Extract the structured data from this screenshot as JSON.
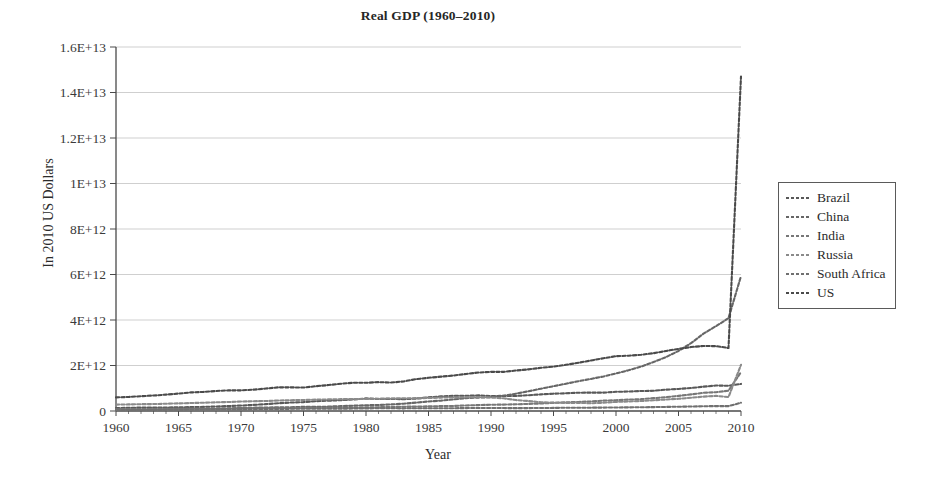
{
  "figure": {
    "title": "Real GDP (1960–2010)",
    "background_color": "#ffffff",
    "width": 928,
    "height": 482
  },
  "axes": {
    "x_title": "Year",
    "y_title": "In 2010 US Dollars",
    "x_ticks": [
      "1960",
      "1965",
      "1970",
      "1975",
      "1980",
      "1985",
      "1990",
      "1995",
      "2000",
      "2005",
      "2010"
    ],
    "y_ticks": [
      "0",
      "2E+12",
      "4E+12",
      "6E+12",
      "8E+12",
      "1E+13",
      "1.2E+13",
      "1.4E+13",
      "1.6E+13"
    ],
    "grid_color": "#c9c9c9",
    "axis_color": "#4a4a4a"
  },
  "legend": {
    "position": "right",
    "entries": [
      {
        "label": "Brazil",
        "color": "#585858",
        "dash": "3,2"
      },
      {
        "label": "China",
        "color": "#666666",
        "dash": "3,2"
      },
      {
        "label": "India",
        "color": "#777777",
        "dash": "3,2"
      },
      {
        "label": "Russia",
        "color": "#8a8a8a",
        "dash": "3,2"
      },
      {
        "label": "South Africa",
        "color": "#707070",
        "dash": "3,2"
      },
      {
        "label": "US",
        "color": "#4a4a4a",
        "dash": "3,2"
      }
    ]
  },
  "chart_data": {
    "type": "line",
    "title": "Real GDP (1960–2010)",
    "xlabel": "Year",
    "ylabel": "In 2010 US Dollars",
    "xlim": [
      1960,
      2010
    ],
    "ylim": [
      0,
      16000000000000
    ],
    "ytick_step": 2000000000000,
    "xtick_step": 5,
    "grid": "horizontal",
    "legend_position": "right",
    "x": [
      1960,
      1961,
      1962,
      1963,
      1964,
      1965,
      1966,
      1967,
      1968,
      1969,
      1970,
      1971,
      1972,
      1973,
      1974,
      1975,
      1976,
      1977,
      1978,
      1979,
      1980,
      1981,
      1982,
      1983,
      1984,
      1985,
      1986,
      1987,
      1988,
      1989,
      1990,
      1991,
      1992,
      1993,
      1994,
      1995,
      1996,
      1997,
      1998,
      1999,
      2000,
      2001,
      2002,
      2003,
      2004,
      2005,
      2006,
      2007,
      2008,
      2009,
      2010
    ],
    "series": [
      {
        "name": "Brazil",
        "color": "#585858",
        "values": [
          130000000000.0,
          142000000000.0,
          149000000000.0,
          150000000000.0,
          155000000000.0,
          160000000000.0,
          172000000000.0,
          180000000000.0,
          199000000000.0,
          217000000000.0,
          240000000000.0,
          268000000000.0,
          301000000000.0,
          343000000000.0,
          371000000000.0,
          391000000000.0,
          431000000000.0,
          452000000000.0,
          474000000000.0,
          506000000000.0,
          553000000000.0,
          529000000000.0,
          533000000000.0,
          518000000000.0,
          546000000000.0,
          598000000000.0,
          643000000000.0,
          666000000000.0,
          666000000000.0,
          687000000000.0,
          658000000000.0,
          665000000000.0,
          661000000000.0,
          694000000000.0,
          731000000000.0,
          762000000000.0,
          778000000000.0,
          805000000000.0,
          806000000000.0,
          808000000000.0,
          843000000000.0,
          855000000000.0,
          878000000000.0,
          888000000000.0,
          939000000000.0,
          969000000000.0,
          1010000000000.0,
          1070000000000.0,
          1120000000000.0,
          1110000000000.0,
          1190000000000.0
        ]
      },
      {
        "name": "China",
        "color": "#666666",
        "values": [
          95000000000.0,
          70000000000.0,
          66000000000.0,
          73000000000.0,
          84000000000.0,
          98000000000.0,
          108000000000.0,
          101000000000.0,
          97000000000.0,
          114000000000.0,
          136000000000.0,
          146000000000.0,
          151000000000.0,
          163000000000.0,
          167000000000.0,
          182000000000.0,
          179000000000.0,
          193000000000.0,
          216000000000.0,
          233000000000.0,
          252000000000.0,
          265000000000.0,
          289000000000.0,
          320000000000.0,
          369000000000.0,
          419000000000.0,
          456000000000.0,
          509000000000.0,
          566000000000.0,
          589000000000.0,
          611000000000.0,
          667000000000.0,
          762000000000.0,
          868000000000.0,
          982000000000.0,
          1090000000000.0,
          1200000000000.0,
          1310000000000.0,
          1410000000000.0,
          1520000000000.0,
          1650000000000.0,
          1790000000000.0,
          1950000000000.0,
          2150000000000.0,
          2370000000000.0,
          2640000000000.0,
          2980000000000.0,
          3400000000000.0,
          3730000000000.0,
          4080000000000.0,
          5930000000000.0
        ]
      },
      {
        "name": "India",
        "color": "#777777",
        "values": [
          79000000000.0,
          82000000000.0,
          84000000000.0,
          90000000000.0,
          96000000000.0,
          92000000000.0,
          93000000000.0,
          101000000000.0,
          104000000000.0,
          111000000000.0,
          117000000000.0,
          118000000000.0,
          117000000000.0,
          122000000000.0,
          123000000000.0,
          135000000000.0,
          137000000000.0,
          148000000000.0,
          156000000000.0,
          147000000000.0,
          158000000000.0,
          168000000000.0,
          175000000000.0,
          188000000000.0,
          195000000000.0,
          205000000000.0,
          214000000000.0,
          222000000000.0,
          245000000000.0,
          260000000000.0,
          275000000000.0,
          281000000000.0,
          296000000000.0,
          310000000000.0,
          330000000000.0,
          355000000000.0,
          382000000000.0,
          397000000000.0,
          421000000000.0,
          456000000000.0,
          474000000000.0,
          500000000000.0,
          520000000000.0,
          564000000000.0,
          609000000000.0,
          666000000000.0,
          729000000000.0,
          799000000000.0,
          825000000000.0,
          894000000000.0,
          1710000000000.0
        ]
      },
      {
        "name": "Russia",
        "color": "#8a8a8a",
        "values": [
          280000000000.0,
          290000000000.0,
          300000000000.0,
          305000000000.0,
          320000000000.0,
          335000000000.0,
          350000000000.0,
          365000000000.0,
          382000000000.0,
          395000000000.0,
          415000000000.0,
          430000000000.0,
          440000000000.0,
          460000000000.0,
          475000000000.0,
          485000000000.0,
          500000000000.0,
          510000000000.0,
          520000000000.0,
          525000000000.0,
          530000000000.0,
          540000000000.0,
          550000000000.0,
          560000000000.0,
          565000000000.0,
          570000000000.0,
          590000000000.0,
          595000000000.0,
          610000000000.0,
          615000000000.0,
          590000000000.0,
          560000000000.0,
          480000000000.0,
          438000000000.0,
          383000000000.0,
          367000000000.0,
          354000000000.0,
          360000000000.0,
          341000000000.0,
          363000000000.0,
          399000000000.0,
          419000000000.0,
          439000000000.0,
          471000000000.0,
          505000000000.0,
          538000000000.0,
          582000000000.0,
          632000000000.0,
          666000000000.0,
          614000000000.0,
          2030000000000.0
        ]
      },
      {
        "name": "South Africa",
        "color": "#707070",
        "values": [
          45000000000.0,
          47000000000.0,
          49000000000.0,
          53000000000.0,
          57000000000.0,
          61000000000.0,
          64000000000.0,
          69000000000.0,
          72000000000.0,
          77000000000.0,
          81000000000.0,
          85000000000.0,
          87000000000.0,
          91000000000.0,
          96000000000.0,
          98000000000.0,
          100000000000.0,
          100000000000.0,
          103000000000.0,
          107000000000.0,
          114000000000.0,
          120000000000.0,
          119000000000.0,
          117000000000.0,
          123000000000.0,
          121000000000.0,
          121000000000.0,
          123000000000.0,
          128000000000.0,
          131000000000.0,
          131000000000.0,
          129000000000.0,
          126000000000.0,
          128000000000.0,
          132000000000.0,
          136000000000.0,
          142000000000.0,
          145000000000.0,
          146000000000.0,
          150000000000.0,
          156000000000.0,
          160000000000.0,
          166000000000.0,
          171000000000.0,
          179000000000.0,
          188000000000.0,
          198000000000.0,
          209000000000.0,
          216000000000.0,
          213000000000.0,
          364000000000.0
        ]
      },
      {
        "name": "US",
        "color": "#4a4a4a",
        "values": [
          600000000000.0,
          615000000000.0,
          652000000000.0,
          680000000000.0,
          720000000000.0,
          766000000000.0,
          817000000000.0,
          838000000000.0,
          879000000000.0,
          906000000000.0,
          908000000000.0,
          938000000000.0,
          988000000000.0,
          1040000000000.0,
          1040000000000.0,
          1030000000000.0,
          1090000000000.0,
          1140000000000.0,
          1200000000000.0,
          1240000000000.0,
          1240000000000.0,
          1270000000000.0,
          1250000000000.0,
          1300000000000.0,
          1400000000000.0,
          1460000000000.0,
          1510000000000.0,
          1560000000000.0,
          1630000000000.0,
          1690000000000.0,
          1720000000000.0,
          1720000000000.0,
          1780000000000.0,
          1830000000000.0,
          1900000000000.0,
          1950000000000.0,
          2030000000000.0,
          2120000000000.0,
          2220000000000.0,
          2320000000000.0,
          2410000000000.0,
          2430000000000.0,
          2470000000000.0,
          2540000000000.0,
          2640000000000.0,
          2730000000000.0,
          2810000000000.0,
          2860000000000.0,
          2850000000000.0,
          2770000000000.0,
          14700000000000.0
        ]
      }
    ]
  }
}
